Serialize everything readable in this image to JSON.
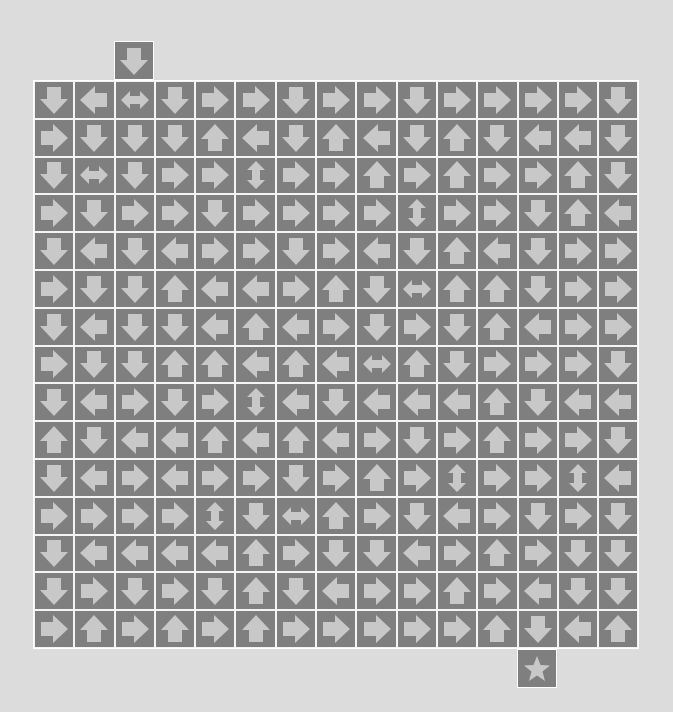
{
  "puzzle": {
    "type": "arrow-path-maze",
    "rows": 15,
    "cols": 15,
    "legend": {
      "U": "up-arrow",
      "D": "down-arrow",
      "L": "left-arrow",
      "R": "right-arrow",
      "LR": "left-right-arrow",
      "UD": "up-down-arrow",
      "S": "star-goal"
    },
    "colors": {
      "background": "#dcdcdc",
      "cell": "#7f7f7f",
      "arrow": "#c8c8c8",
      "grid_line": "#ffffff"
    },
    "start": {
      "col": 2,
      "arrow": "D"
    },
    "goal": {
      "col": 12,
      "icon": "S"
    },
    "grid": [
      [
        "D",
        "L",
        "LR",
        "D",
        "R",
        "R",
        "D",
        "R",
        "R",
        "D",
        "R",
        "R",
        "R",
        "R",
        "D"
      ],
      [
        "R",
        "D",
        "D",
        "D",
        "U",
        "L",
        "D",
        "U",
        "L",
        "D",
        "U",
        "D",
        "L",
        "L",
        "D"
      ],
      [
        "D",
        "LR",
        "D",
        "R",
        "R",
        "UD",
        "R",
        "R",
        "U",
        "R",
        "U",
        "R",
        "R",
        "U",
        "D"
      ],
      [
        "R",
        "D",
        "R",
        "R",
        "D",
        "R",
        "R",
        "R",
        "R",
        "UD",
        "R",
        "R",
        "D",
        "U",
        "L"
      ],
      [
        "D",
        "L",
        "D",
        "L",
        "R",
        "R",
        "D",
        "R",
        "L",
        "D",
        "U",
        "L",
        "D",
        "R",
        "R"
      ],
      [
        "R",
        "D",
        "D",
        "U",
        "L",
        "L",
        "R",
        "U",
        "D",
        "LR",
        "U",
        "U",
        "D",
        "R",
        "R"
      ],
      [
        "D",
        "L",
        "D",
        "D",
        "L",
        "U",
        "L",
        "R",
        "D",
        "R",
        "D",
        "U",
        "L",
        "R",
        "R"
      ],
      [
        "R",
        "D",
        "D",
        "U",
        "U",
        "L",
        "U",
        "L",
        "LR",
        "U",
        "D",
        "R",
        "R",
        "R",
        "D"
      ],
      [
        "D",
        "L",
        "R",
        "D",
        "R",
        "UD",
        "L",
        "D",
        "L",
        "L",
        "L",
        "U",
        "D",
        "L",
        "L"
      ],
      [
        "U",
        "D",
        "L",
        "L",
        "U",
        "L",
        "U",
        "L",
        "R",
        "D",
        "R",
        "U",
        "R",
        "R",
        "D"
      ],
      [
        "D",
        "L",
        "R",
        "L",
        "R",
        "R",
        "D",
        "R",
        "U",
        "R",
        "UD",
        "R",
        "R",
        "UD",
        "L"
      ],
      [
        "R",
        "R",
        "R",
        "R",
        "UD",
        "D",
        "LR",
        "U",
        "R",
        "D",
        "L",
        "R",
        "D",
        "R",
        "D"
      ],
      [
        "D",
        "L",
        "L",
        "L",
        "L",
        "U",
        "R",
        "D",
        "D",
        "L",
        "R",
        "U",
        "R",
        "D",
        "D"
      ],
      [
        "D",
        "R",
        "D",
        "R",
        "D",
        "U",
        "D",
        "L",
        "R",
        "R",
        "U",
        "R",
        "L",
        "D",
        "D"
      ],
      [
        "R",
        "U",
        "R",
        "U",
        "R",
        "U",
        "R",
        "R",
        "R",
        "R",
        "R",
        "U",
        "D",
        "L",
        "U"
      ]
    ]
  }
}
